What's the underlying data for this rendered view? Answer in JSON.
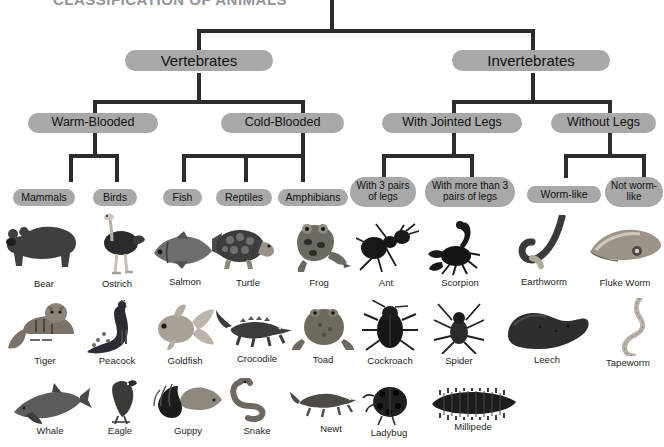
{
  "title": "CLASSIFICATION OF ANIMALS",
  "diagram": {
    "type": "tree",
    "root": "Animals",
    "levels": [
      {
        "level": 1,
        "nodes": [
          {
            "id": "vertebrates",
            "label": "Vertebrates"
          },
          {
            "id": "invertebrates",
            "label": "Invertebrates"
          }
        ]
      },
      {
        "level": 2,
        "nodes": [
          {
            "id": "warm-blooded",
            "label": "Warm-Blooded",
            "parent": "vertebrates"
          },
          {
            "id": "cold-blooded",
            "label": "Cold-Blooded",
            "parent": "vertebrates"
          },
          {
            "id": "with-jointed-legs",
            "label": "With Jointed Legs",
            "parent": "invertebrates"
          },
          {
            "id": "without-legs",
            "label": "Without Legs",
            "parent": "invertebrates"
          }
        ]
      },
      {
        "level": 3,
        "nodes": [
          {
            "id": "mammals",
            "label": "Mammals",
            "parent": "warm-blooded"
          },
          {
            "id": "birds",
            "label": "Birds",
            "parent": "warm-blooded"
          },
          {
            "id": "fish",
            "label": "Fish",
            "parent": "cold-blooded"
          },
          {
            "id": "reptiles",
            "label": "Reptiles",
            "parent": "cold-blooded"
          },
          {
            "id": "amphibians",
            "label": "Amphibians",
            "parent": "cold-blooded"
          },
          {
            "id": "three-pairs",
            "label": "With 3 pairs of legs",
            "parent": "with-jointed-legs"
          },
          {
            "id": "more-than-three",
            "label": "With more than 3 pairs of legs",
            "parent": "with-jointed-legs"
          },
          {
            "id": "worm-like",
            "label": "Worm-like",
            "parent": "without-legs"
          },
          {
            "id": "not-worm-like",
            "label": "Not worm-like",
            "parent": "without-legs"
          }
        ]
      }
    ]
  },
  "columns": [
    {
      "group": "mammals",
      "examples": [
        "Bear",
        "Tiger",
        "Whale"
      ]
    },
    {
      "group": "birds",
      "examples": [
        "Ostrich",
        "Peacock",
        "Eagle"
      ]
    },
    {
      "group": "fish",
      "examples": [
        "Salmon",
        "Goldfish",
        "Guppy"
      ]
    },
    {
      "group": "reptiles",
      "examples": [
        "Turtle",
        "Crocodile",
        "Snake"
      ]
    },
    {
      "group": "amphibians",
      "examples": [
        "Frog",
        "Toad",
        "Newt"
      ]
    },
    {
      "group": "three-pairs",
      "examples": [
        "Ant",
        "Cockroach",
        "Ladybug"
      ]
    },
    {
      "group": "more-than-three",
      "examples": [
        "Scorpion",
        "Spider",
        "Millipede"
      ]
    },
    {
      "group": "worm-like",
      "examples": [
        "Earthworm",
        "Leech",
        "Tapeworm"
      ]
    },
    {
      "group": "not-worm-like",
      "examples": [
        "Fluke Worm"
      ]
    }
  ],
  "specimens": [
    {
      "name": "Bear",
      "icon": "bear-illustration"
    },
    {
      "name": "Ostrich",
      "icon": "ostrich-illustration"
    },
    {
      "name": "Salmon",
      "icon": "salmon-illustration"
    },
    {
      "name": "Turtle",
      "icon": "turtle-illustration"
    },
    {
      "name": "Frog",
      "icon": "frog-illustration"
    },
    {
      "name": "Ant",
      "icon": "ant-illustration"
    },
    {
      "name": "Scorpion",
      "icon": "scorpion-illustration"
    },
    {
      "name": "Earthworm",
      "icon": "earthworm-illustration"
    },
    {
      "name": "Fluke Worm",
      "icon": "fluke-worm-illustration"
    },
    {
      "name": "Tiger",
      "icon": "tiger-illustration"
    },
    {
      "name": "Peacock",
      "icon": "peacock-illustration"
    },
    {
      "name": "Goldfish",
      "icon": "goldfish-illustration"
    },
    {
      "name": "Crocodile",
      "icon": "crocodile-illustration"
    },
    {
      "name": "Toad",
      "icon": "toad-illustration"
    },
    {
      "name": "Cockroach",
      "icon": "cockroach-illustration"
    },
    {
      "name": "Spider",
      "icon": "spider-illustration"
    },
    {
      "name": "Leech",
      "icon": "leech-illustration"
    },
    {
      "name": "Tapeworm",
      "icon": "tapeworm-illustration"
    },
    {
      "name": "Whale",
      "icon": "whale-illustration"
    },
    {
      "name": "Eagle",
      "icon": "eagle-illustration"
    },
    {
      "name": "Guppy",
      "icon": "guppy-illustration"
    },
    {
      "name": "Snake",
      "icon": "snake-illustration"
    },
    {
      "name": "Newt",
      "icon": "newt-illustration"
    },
    {
      "name": "Ladybug",
      "icon": "ladybug-illustration"
    },
    {
      "name": "Millipede",
      "icon": "millipede-illustration"
    }
  ],
  "colors": {
    "pill_fill": "#a8a8a8",
    "line": "#2c2c2c",
    "text": "#101010",
    "background": "#ffffff"
  }
}
